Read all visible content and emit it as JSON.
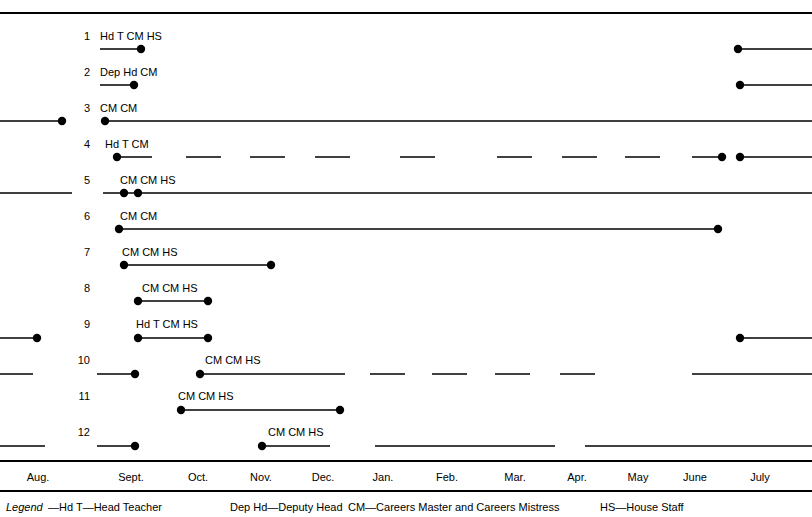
{
  "figure": {
    "axis": {
      "months": [
        {
          "label": "Aug.",
          "x": 38
        },
        {
          "label": "Sept.",
          "x": 131
        },
        {
          "label": "Oct.",
          "x": 198
        },
        {
          "label": "Nov.",
          "x": 261
        },
        {
          "label": "Dec.",
          "x": 323
        },
        {
          "label": "Jan.",
          "x": 383
        },
        {
          "label": "Feb.",
          "x": 447
        },
        {
          "label": "Mar.",
          "x": 515
        },
        {
          "label": "Apr.",
          "x": 577
        },
        {
          "label": "May",
          "x": 638
        },
        {
          "label": "June",
          "x": 695
        },
        {
          "label": "July",
          "x": 760
        }
      ]
    },
    "legend": {
      "word": "Legend",
      "entries": [
        {
          "text": "—Hd T—Head Teacher",
          "x": 48
        },
        {
          "text": "Dep Hd—Deputy Head",
          "x": 230
        },
        {
          "text": "CM—Careers Master and Careers Mistress",
          "x": 348
        },
        {
          "text": "HS—House Staff",
          "x": 600
        }
      ]
    }
  },
  "chart_data": {
    "type": "timeline",
    "title": "",
    "xlabel": "",
    "ylabel": "",
    "x_tick_labels": [
      "Aug.",
      "Sept.",
      "Oct.",
      "Nov.",
      "Dec.",
      "Jan.",
      "Feb.",
      "Mar.",
      "Apr.",
      "May",
      "June",
      "July"
    ],
    "categories": [
      "1",
      "2",
      "3",
      "4",
      "5",
      "6",
      "7",
      "8",
      "9",
      "10",
      "11",
      "12"
    ],
    "legend_entries": [
      "Hd T—Head Teacher",
      "Dep Hd—Deputy Head",
      "CM—Careers Master and Careers Mistress",
      "HS—House Staff"
    ],
    "grid": false,
    "legend_position": "bottom",
    "rows": [
      {
        "number": "1",
        "label_y": 36,
        "y": 49,
        "roles": [
          {
            "text": "Hd T CM HS",
            "x": 100
          }
        ],
        "segments": [
          {
            "x1": 100,
            "x2": 141,
            "dashed": false
          },
          {
            "x1": 738,
            "x2": 812,
            "dashed": false
          }
        ],
        "dots": [
          141,
          738
        ]
      },
      {
        "number": "2",
        "label_y": 72,
        "y": 85,
        "roles": [
          {
            "text": "Dep Hd CM",
            "x": 100
          }
        ],
        "segments": [
          {
            "x1": 100,
            "x2": 134,
            "dashed": false
          },
          {
            "x1": 740,
            "x2": 812,
            "dashed": false
          }
        ],
        "dots": [
          134,
          740
        ]
      },
      {
        "number": "3",
        "label_y": 108,
        "y": 121,
        "roles": [
          {
            "text": "CM CM",
            "x": 100
          }
        ],
        "segments": [
          {
            "x1": 0,
            "x2": 62,
            "dashed": false
          },
          {
            "x1": 105,
            "x2": 812,
            "dashed": false
          }
        ],
        "dots": [
          62,
          105
        ]
      },
      {
        "number": "4",
        "label_y": 144,
        "y": 157,
        "roles": [
          {
            "text": "Hd T CM",
            "x": 105
          }
        ],
        "segments": [
          {
            "x1": 117,
            "x2": 152,
            "dashed": false
          },
          {
            "x1": 186,
            "x2": 221,
            "dashed": false
          },
          {
            "x1": 250,
            "x2": 285,
            "dashed": false
          },
          {
            "x1": 315,
            "x2": 350,
            "dashed": false
          },
          {
            "x1": 400,
            "x2": 435,
            "dashed": false
          },
          {
            "x1": 497,
            "x2": 532,
            "dashed": false
          },
          {
            "x1": 562,
            "x2": 597,
            "dashed": false
          },
          {
            "x1": 625,
            "x2": 660,
            "dashed": false
          },
          {
            "x1": 692,
            "x2": 722,
            "dashed": false
          },
          {
            "x1": 740,
            "x2": 812,
            "dashed": false
          }
        ],
        "dots": [
          117,
          722,
          740
        ]
      },
      {
        "number": "5",
        "label_y": 180,
        "y": 193,
        "roles": [
          {
            "text": "CM CM  HS",
            "x": 120
          }
        ],
        "segments": [
          {
            "x1": 0,
            "x2": 72,
            "dashed": false
          },
          {
            "x1": 103,
            "x2": 812,
            "dashed": false
          }
        ],
        "dots": [
          124,
          138
        ]
      },
      {
        "number": "6",
        "label_y": 216,
        "y": 229,
        "roles": [
          {
            "text": "CM CM",
            "x": 120
          }
        ],
        "segments": [
          {
            "x1": 119,
            "x2": 718,
            "dashed": false
          }
        ],
        "dots": [
          119,
          718
        ]
      },
      {
        "number": "7",
        "label_y": 252,
        "y": 265,
        "roles": [
          {
            "text": "CM CM  HS",
            "x": 122
          }
        ],
        "segments": [
          {
            "x1": 124,
            "x2": 271,
            "dashed": false
          }
        ],
        "dots": [
          124,
          271
        ]
      },
      {
        "number": "8",
        "label_y": 288,
        "y": 301,
        "roles": [
          {
            "text": "CM   CM   HS",
            "x": 142
          }
        ],
        "segments": [
          {
            "x1": 138,
            "x2": 208,
            "dashed": false
          }
        ],
        "dots": [
          138,
          208
        ]
      },
      {
        "number": "9",
        "label_y": 324,
        "y": 338,
        "roles": [
          {
            "text": "Hd T  CM HS",
            "x": 136
          }
        ],
        "segments": [
          {
            "x1": 0,
            "x2": 37,
            "dashed": false
          },
          {
            "x1": 138,
            "x2": 208,
            "dashed": false
          },
          {
            "x1": 740,
            "x2": 812,
            "dashed": false
          }
        ],
        "dots": [
          37,
          138,
          208,
          740
        ]
      },
      {
        "number": "10",
        "label_y": 360,
        "y": 374,
        "roles": [
          {
            "text": "CM   CM HS",
            "x": 205
          }
        ],
        "segments": [
          {
            "x1": 0,
            "x2": 33,
            "dashed": false
          },
          {
            "x1": 97,
            "x2": 135,
            "dashed": false
          },
          {
            "x1": 200,
            "x2": 345,
            "dashed": false
          },
          {
            "x1": 370,
            "x2": 405,
            "dashed": false
          },
          {
            "x1": 432,
            "x2": 467,
            "dashed": false
          },
          {
            "x1": 495,
            "x2": 530,
            "dashed": false
          },
          {
            "x1": 560,
            "x2": 595,
            "dashed": false
          },
          {
            "x1": 692,
            "x2": 812,
            "dashed": false
          }
        ],
        "dots": [
          135,
          200
        ]
      },
      {
        "number": "11",
        "label_y": 396,
        "y": 410,
        "roles": [
          {
            "text": "CM CM  HS",
            "x": 178
          }
        ],
        "segments": [
          {
            "x1": 181,
            "x2": 340,
            "dashed": false
          }
        ],
        "dots": [
          181,
          340
        ]
      },
      {
        "number": "12",
        "label_y": 432,
        "y": 446,
        "roles": [
          {
            "text": "CM   CM HS",
            "x": 268
          }
        ],
        "segments": [
          {
            "x1": 0,
            "x2": 45,
            "dashed": false
          },
          {
            "x1": 97,
            "x2": 135,
            "dashed": false
          },
          {
            "x1": 262,
            "x2": 330,
            "dashed": false
          },
          {
            "x1": 375,
            "x2": 555,
            "dashed": false
          },
          {
            "x1": 585,
            "x2": 812,
            "dashed": false
          }
        ],
        "dots": [
          135,
          262
        ]
      }
    ]
  }
}
